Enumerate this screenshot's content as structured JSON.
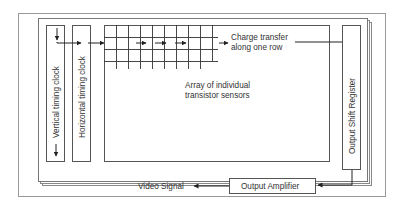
{
  "diagram": {
    "labels": {
      "vertical_clock": "Vertical timing clock",
      "horizontal_clock": "Horizontal timing clock",
      "charge_transfer_line1": "Charge transfer",
      "charge_transfer_line2": "along one row",
      "array_line1": "Array of individual",
      "array_line2": "transistor sensors",
      "shift_register": "Output Shift Register",
      "amplifier": "Output Amplifier",
      "video_signal": "Video Signal"
    },
    "colors": {
      "line": "#333333",
      "frame": "#888888",
      "background": "#ffffff"
    },
    "grid": {
      "columns": 9,
      "rows": 4
    }
  }
}
